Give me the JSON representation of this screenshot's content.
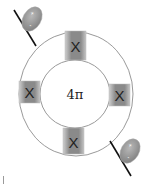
{
  "diagram": {
    "center_label": "4π",
    "square_label": "X",
    "ring": {
      "outer": {
        "cx": 76,
        "cy": 94,
        "rx": 57,
        "ry": 62
      },
      "inner": {
        "cx": 75,
        "cy": 94,
        "rx": 35,
        "ry": 34
      },
      "stroke_color": "#9a9a9a"
    },
    "squares": [
      {
        "id": "top",
        "x": 65,
        "y": 31,
        "w": 21,
        "h": 29,
        "label": "X"
      },
      {
        "id": "left",
        "x": 19,
        "y": 81,
        "w": 21,
        "h": 22,
        "label": "X"
      },
      {
        "id": "right",
        "x": 109,
        "y": 84,
        "w": 21,
        "h": 22,
        "label": "X"
      },
      {
        "id": "bottom",
        "x": 63,
        "y": 128,
        "w": 21,
        "h": 26,
        "label": "X"
      }
    ],
    "charges": [
      {
        "id": "top-left",
        "plus": "+",
        "minus": "-",
        "line": [
          14,
          10,
          36,
          46
        ],
        "cx": 32,
        "cy": 20,
        "rx": 9,
        "ry": 13,
        "rotate": -30
      },
      {
        "id": "bottom-right",
        "plus": "+",
        "minus": "-",
        "line": [
          110,
          141,
          131,
          176
        ],
        "cx": 130,
        "cy": 151,
        "rx": 9,
        "ry": 13,
        "rotate": -30
      }
    ],
    "colors": {
      "square_fill": "#8e8e8e",
      "square_edge": "#c8c8c8",
      "ellipse_fill": "#9a9a9a",
      "line": "#111111",
      "text": "#222222"
    }
  }
}
